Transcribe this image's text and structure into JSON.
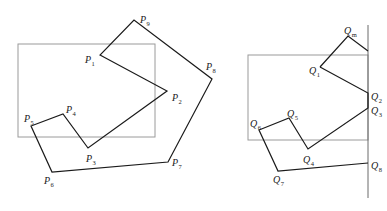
{
  "figure": {
    "left_panel": {
      "name": "original-polygon",
      "clip_window": {
        "x": 18,
        "y": 44,
        "w": 137,
        "h": 93
      },
      "vertices": [
        {
          "id": "P1",
          "letter": "P",
          "sub": "1",
          "x": 100,
          "y": 55,
          "lx": 85,
          "ly": 63
        },
        {
          "id": "P2",
          "letter": "P",
          "sub": "2",
          "x": 167,
          "y": 91,
          "lx": 172,
          "ly": 101
        },
        {
          "id": "P3",
          "letter": "P",
          "sub": "3",
          "x": 88,
          "y": 148,
          "lx": 86,
          "ly": 162
        },
        {
          "id": "P4",
          "letter": "P",
          "sub": "4",
          "x": 63,
          "y": 114,
          "lx": 66,
          "ly": 113
        },
        {
          "id": "P5",
          "letter": "P",
          "sub": "5",
          "x": 31,
          "y": 126,
          "lx": 24,
          "ly": 122
        },
        {
          "id": "P6",
          "letter": "P",
          "sub": "6",
          "x": 52,
          "y": 172,
          "lx": 44,
          "ly": 184
        },
        {
          "id": "P7",
          "letter": "P",
          "sub": "7",
          "x": 168,
          "y": 162,
          "lx": 172,
          "ly": 166
        },
        {
          "id": "P8",
          "letter": "P",
          "sub": "8",
          "x": 212,
          "y": 79,
          "lx": 206,
          "ly": 70
        },
        {
          "id": "P9",
          "letter": "P",
          "sub": "9",
          "x": 134,
          "y": 20,
          "lx": 140,
          "ly": 23
        }
      ]
    },
    "right_panel": {
      "name": "clipped-against-right-edge",
      "clip_window": {
        "x": 248,
        "y": 55,
        "w": 120,
        "h": 85
      },
      "clip_edge_x": 368,
      "clip_edge_y1": 25,
      "clip_edge_y2": 198,
      "vertices": [
        {
          "id": "Q1",
          "letter": "Q",
          "sub": "1",
          "x": 320,
          "y": 67,
          "lx": 309,
          "ly": 74
        },
        {
          "id": "Q2",
          "letter": "Q",
          "sub": "2",
          "x": 368,
          "y": 93,
          "lx": 371,
          "ly": 100
        },
        {
          "id": "Q3",
          "letter": "Q",
          "sub": "3",
          "x": 368,
          "y": 108,
          "lx": 371,
          "ly": 114
        },
        {
          "id": "Q4",
          "letter": "Q",
          "sub": "4",
          "x": 308,
          "y": 149,
          "lx": 303,
          "ly": 163
        },
        {
          "id": "Q5",
          "letter": "Q",
          "sub": "5",
          "x": 289,
          "y": 118,
          "lx": 287,
          "ly": 117
        },
        {
          "id": "Q6",
          "letter": "Q",
          "sub": "6",
          "x": 259,
          "y": 130,
          "lx": 250,
          "ly": 127
        },
        {
          "id": "Q7",
          "letter": "Q",
          "sub": "7",
          "x": 278,
          "y": 171,
          "lx": 273,
          "ly": 183
        },
        {
          "id": "Q8",
          "letter": "Q",
          "sub": "8",
          "x": 368,
          "y": 163,
          "lx": 371,
          "ly": 169
        },
        {
          "id": "Qm",
          "letter": "Q",
          "sub": "m",
          "x": 348,
          "y": 36,
          "lx": 344,
          "ly": 34
        }
      ],
      "path_order": [
        "Q1",
        "Q2",
        "Q3",
        "Q4",
        "Q5",
        "Q6",
        "Q7",
        "Q8"
      ],
      "extra_segments": [
        [
          "Q1",
          "Qm"
        ],
        [
          "Qm",
          "edge_top"
        ]
      ],
      "edge_top_point": {
        "x": 368,
        "y": 51
      }
    }
  }
}
